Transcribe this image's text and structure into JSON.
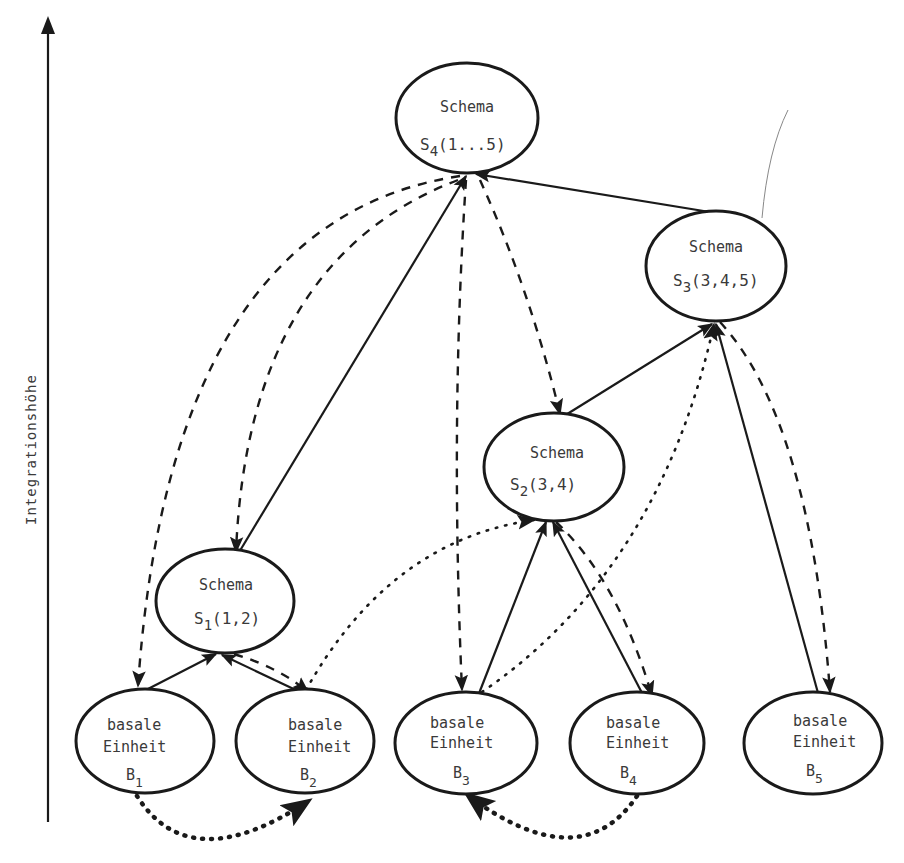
{
  "axis": {
    "label": "Integrationshöhe",
    "direction": "up"
  },
  "nodes": {
    "s4": {
      "title": "Schema",
      "sym": "S",
      "sub": "4",
      "args": "(1...5)"
    },
    "s3": {
      "title": "Schema",
      "sym": "S",
      "sub": "3",
      "args": "(3,4,5)"
    },
    "s2": {
      "title": "Schema",
      "sym": "S",
      "sub": "2",
      "args": "(3,4)"
    },
    "s1": {
      "title": "Schema",
      "sym": "S",
      "sub": "1",
      "args": "(1,2)"
    },
    "b1": {
      "line1": "basale",
      "line2": "Einheit",
      "sym": "B",
      "sub": "1"
    },
    "b2": {
      "line1": "basale",
      "line2": "Einheit",
      "sym": "B",
      "sub": "2"
    },
    "b3": {
      "line1": "basale",
      "line2": "Einheit",
      "sym": "B",
      "sub": "3"
    },
    "b4": {
      "line1": "basale",
      "line2": "Einheit",
      "sym": "B",
      "sub": "4"
    },
    "b5": {
      "line1": "basale",
      "line2": "Einheit",
      "sym": "B",
      "sub": "5"
    }
  },
  "edges": [
    {
      "from": "S1",
      "to": "S4",
      "style": "solid"
    },
    {
      "from": "S3",
      "to": "S4",
      "style": "solid"
    },
    {
      "from": "S2",
      "to": "S3",
      "style": "solid"
    },
    {
      "from": "B1",
      "to": "S1",
      "style": "solid"
    },
    {
      "from": "B2",
      "to": "S1",
      "style": "solid"
    },
    {
      "from": "B3",
      "to": "S2",
      "style": "solid"
    },
    {
      "from": "B4",
      "to": "S2",
      "style": "solid"
    },
    {
      "from": "B5",
      "to": "S3",
      "style": "solid"
    },
    {
      "from": "S4",
      "to": "B1",
      "style": "dashed"
    },
    {
      "from": "S4",
      "to": "S1",
      "style": "dashed"
    },
    {
      "from": "S4",
      "to": "B3",
      "style": "dashed"
    },
    {
      "from": "S4",
      "to": "S2",
      "style": "dashed"
    },
    {
      "from": "S1",
      "to": "B2",
      "style": "dashed"
    },
    {
      "from": "S2",
      "to": "B4",
      "style": "dashed"
    },
    {
      "from": "S3",
      "to": "B5",
      "style": "dashed"
    },
    {
      "from": "B2",
      "to": "S2",
      "style": "dotted"
    },
    {
      "from": "B3",
      "to": "S3",
      "style": "dotted"
    },
    {
      "from": "B1",
      "to": "B2",
      "style": "dotted-heavy"
    },
    {
      "from": "B4",
      "to": "B3",
      "style": "dotted-heavy"
    }
  ]
}
